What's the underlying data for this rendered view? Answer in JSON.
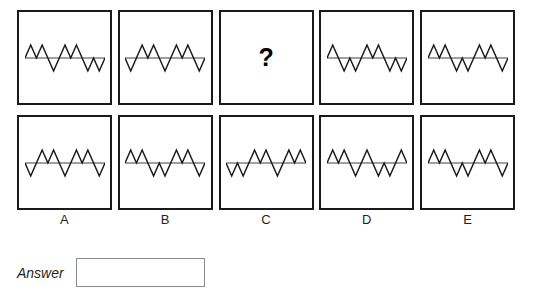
{
  "puzzle": {
    "type": "zigzag-waveform-sequence",
    "question_mark": "?",
    "missing_cell": {
      "row": 0,
      "column": 2,
      "label": "C"
    },
    "baseline_color": "#808080",
    "stroke_color": "#1a1a1a",
    "box_border_color": "#1a1a1a",
    "answer": {
      "label": "Answer",
      "value": "",
      "placeholder": ""
    },
    "column_labels": [
      "A",
      "B",
      "C",
      "D",
      "E"
    ],
    "rows": [
      {
        "name": "top-row",
        "cells": [
          {
            "label": "A",
            "kind": "waveform",
            "directions": [
              "up",
              "up",
              "down",
              "up",
              "up",
              "down",
              "down"
            ]
          },
          {
            "label": "B",
            "kind": "waveform",
            "directions": [
              "down",
              "up",
              "up",
              "down",
              "up",
              "up",
              "down"
            ]
          },
          {
            "label": "C",
            "kind": "question",
            "directions": []
          },
          {
            "label": "D",
            "kind": "waveform",
            "directions": [
              "up",
              "down",
              "down",
              "up",
              "up",
              "down",
              "down"
            ]
          },
          {
            "label": "E",
            "kind": "waveform",
            "directions": [
              "up",
              "up",
              "down",
              "down",
              "up",
              "up",
              "down"
            ]
          }
        ]
      },
      {
        "name": "bottom-row",
        "cells": [
          {
            "label": "A",
            "kind": "waveform",
            "directions": [
              "down",
              "up",
              "up",
              "down",
              "up",
              "up",
              "down"
            ]
          },
          {
            "label": "B",
            "kind": "waveform",
            "directions": [
              "up",
              "up",
              "down",
              "down",
              "up",
              "up",
              "down"
            ]
          },
          {
            "label": "C",
            "kind": "waveform",
            "directions": [
              "down",
              "down",
              "up",
              "up",
              "down",
              "up",
              "up"
            ]
          },
          {
            "label": "D",
            "kind": "waveform",
            "directions": [
              "up",
              "up",
              "down",
              "up",
              "down",
              "down",
              "up"
            ]
          },
          {
            "label": "E",
            "kind": "waveform",
            "directions": [
              "up",
              "up",
              "down",
              "down",
              "up",
              "up",
              "down"
            ]
          }
        ]
      }
    ]
  }
}
